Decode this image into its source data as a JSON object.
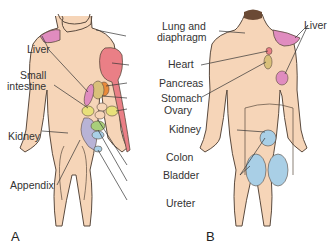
{
  "figure_a": {
    "letter": "A",
    "labels": {
      "liver": "Liver",
      "small_intestine_1": "Small",
      "small_intestine_2": "intestine",
      "kidney": "Kidney",
      "appendix": "Appendix",
      "lung_1": "Lung and",
      "lung_2": "diaphragm",
      "heart": "Heart",
      "pancreas": "Pancreas",
      "stomach": "Stomach",
      "ovary": "Ovary",
      "colon": "Colon",
      "bladder": "Bladder",
      "ureter": "Ureter"
    }
  },
  "figure_b": {
    "letter": "B",
    "labels": {
      "liver": "Liver",
      "kidney": "Kidney"
    }
  },
  "colors": {
    "skin": "#f6d5b8",
    "outline": "#5a4a3e",
    "liver": "#e08cbf",
    "heart": "#ea7f86",
    "pancreas": "#e98a3a",
    "stomach": "#d9c07a",
    "ovary": "#e8e07a",
    "kidney": "#b8b3d6",
    "colon": "#a8cf7a",
    "bladder": "#a9cfe6",
    "hair": "#6b4a35"
  }
}
